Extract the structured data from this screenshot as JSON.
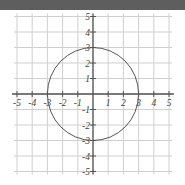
{
  "chart_data": {
    "type": "line",
    "title": "",
    "xlabel": "",
    "ylabel": "",
    "xlim": [
      -5,
      5
    ],
    "ylim": [
      -5,
      5
    ],
    "grid": true,
    "x_ticks": [
      -5,
      -4,
      -3,
      -2,
      -1,
      1,
      2,
      3,
      4,
      5
    ],
    "y_ticks": [
      5,
      4,
      3,
      2,
      1,
      -1,
      -2,
      -3,
      -4,
      -5
    ],
    "x_tick_labels": [
      "-5",
      "-4",
      "-3",
      "-2",
      "-1",
      "1",
      "2",
      "3",
      "4",
      "5"
    ],
    "y_tick_labels": [
      "5",
      "4",
      "3",
      "2",
      "1",
      "-1",
      "-2",
      "-3",
      "-4",
      "-5"
    ],
    "series": [
      {
        "name": "circle",
        "shape": "circle",
        "center": [
          0,
          0
        ],
        "radius": 3,
        "equation": "x^2 + y^2 = 9",
        "color": "#555555"
      }
    ]
  },
  "style": {
    "topbar_color": "#5e5e5e",
    "grid_color": "#cfcfcf",
    "axis_color": "#555555"
  }
}
